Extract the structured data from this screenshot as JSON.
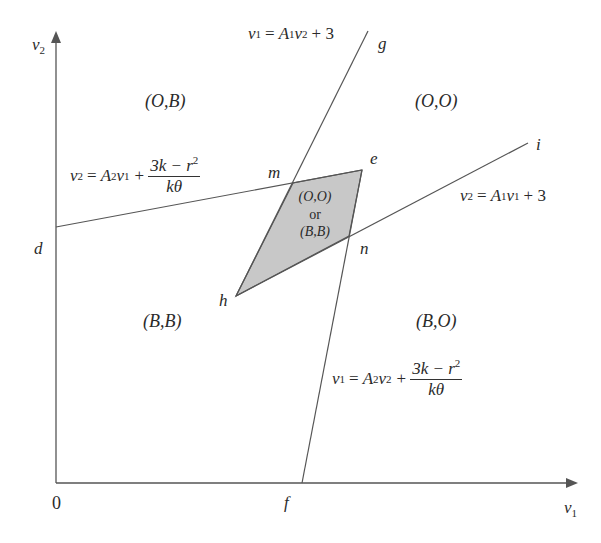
{
  "axes": {
    "x_label": "v",
    "x_sub": "1",
    "y_label": "v",
    "y_sub": "2",
    "origin_label": "0"
  },
  "points": {
    "d": "d",
    "e": "e",
    "f": "f",
    "g": "g",
    "h": "h",
    "i": "i",
    "m": "m",
    "n": "n"
  },
  "regions": {
    "top_left": "(O,B)",
    "top_right": "(O,O)",
    "bottom_left": "(B,B)",
    "bottom_right": "(B,O)",
    "shaded_line1": "(O,O)",
    "shaded_line2": "or",
    "shaded_line3": "(B,B)"
  },
  "equations": {
    "line_hg": {
      "lhs": "v",
      "lhs_sub": "1",
      "rhs_a": "A",
      "rhs_a_sub": "1",
      "rhs_v": "v",
      "rhs_v_sub": "2",
      "rhs_tail": "+ 3"
    },
    "line_hi": {
      "lhs": "v",
      "lhs_sub": "2",
      "rhs_a": "A",
      "rhs_a_sub": "1",
      "rhs_v": "v",
      "rhs_v_sub": "1",
      "rhs_tail": "+ 3"
    },
    "line_de": {
      "lhs": "v",
      "lhs_sub": "2",
      "rhs_a": "A",
      "rhs_a_sub": "2",
      "rhs_v": "v",
      "rhs_v_sub": "1",
      "plus": "+",
      "num": "3k − r",
      "num_sup": "2",
      "den": "kθ"
    },
    "line_fe": {
      "lhs": "v",
      "lhs_sub": "1",
      "rhs_a": "A",
      "rhs_a_sub": "2",
      "rhs_v": "v",
      "rhs_v_sub": "2",
      "plus": "+",
      "num": "3k − r",
      "num_sup": "2",
      "den": "kθ"
    }
  },
  "colors": {
    "line": "#555555",
    "shade": "#c8c8c8",
    "background": "#ffffff"
  },
  "geometry": {
    "origin": [
      56,
      483
    ],
    "x_axis_end": [
      577,
      483
    ],
    "y_axis_end": [
      56,
      32
    ],
    "d": [
      56,
      227
    ],
    "m": [
      293,
      183
    ],
    "e": [
      362,
      170
    ],
    "n": [
      349,
      236
    ],
    "h": [
      236,
      296
    ],
    "f": [
      302,
      483
    ],
    "g": [
      368,
      31
    ],
    "i": [
      528,
      143
    ]
  }
}
